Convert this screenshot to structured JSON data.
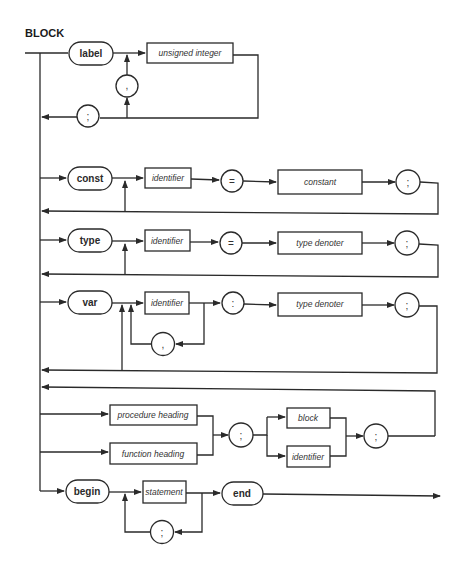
{
  "diagram": {
    "title": "BLOCK",
    "colors": {
      "line": "#2a2a2a",
      "background": "#ffffff"
    },
    "label_section": {
      "keyword": "label",
      "item": "unsigned integer",
      "separator": ",",
      "terminator": ";"
    },
    "const_section": {
      "keyword": "const",
      "name": "identifier",
      "equals": "=",
      "value": "constant",
      "terminator": ";"
    },
    "type_section": {
      "keyword": "type",
      "name": "identifier",
      "equals": "=",
      "value": "type denoter",
      "terminator": ";"
    },
    "var_section": {
      "keyword": "var",
      "name": "identifier",
      "separator": ",",
      "colon": ":",
      "value": "type denoter",
      "terminator": ";"
    },
    "routine_section": {
      "procedure": "procedure heading",
      "function": "function heading",
      "separator": ";",
      "block": "block",
      "directive": "identifier",
      "terminator": ";"
    },
    "body_section": {
      "begin": "begin",
      "statement": "statement",
      "separator": ";",
      "end": "end"
    }
  }
}
